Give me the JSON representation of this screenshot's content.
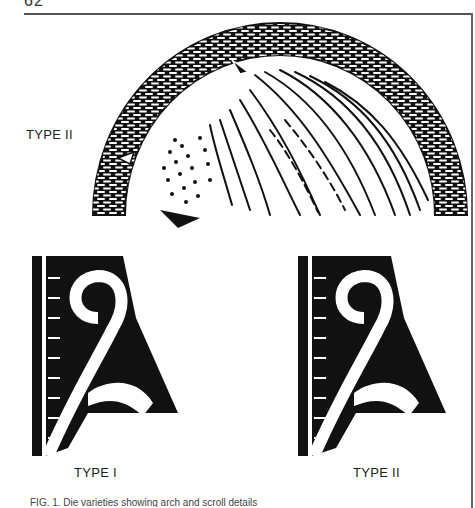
{
  "page": {
    "number": "62"
  },
  "figure": {
    "top_label": "TYPE II",
    "bottom_left_label": "TYPE I",
    "bottom_right_label": "TYPE II",
    "caption_fragment": "FIG. 1. Die varieties showing arch and scroll details"
  },
  "colors": {
    "ink": "#111111",
    "paper": "#ffffff",
    "rule": "#555555"
  }
}
